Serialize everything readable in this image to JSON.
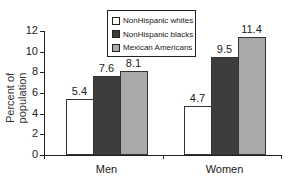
{
  "chart_data": {
    "type": "bar",
    "title": "",
    "xlabel": "",
    "ylabel": "Percent of population",
    "ylim": [
      0,
      12
    ],
    "yticks": [
      0,
      2,
      4,
      6,
      8,
      10,
      12
    ],
    "grid": false,
    "legend_position": "top-center",
    "categories": [
      "Men",
      "Women"
    ],
    "series": [
      {
        "name": "NonHispanic whites",
        "color": "#ffffff",
        "values": [
          5.4,
          4.7
        ]
      },
      {
        "name": "NonHispanic blacks",
        "color": "#3d3d3d",
        "values": [
          7.6,
          9.5
        ]
      },
      {
        "name": "Mexican Americans",
        "color": "#a9a9a9",
        "values": [
          8.1,
          11.4
        ]
      }
    ],
    "data_labels": [
      [
        "5.4",
        "7.6",
        "8.1"
      ],
      [
        "4.7",
        "9.5",
        "11.4"
      ]
    ]
  }
}
